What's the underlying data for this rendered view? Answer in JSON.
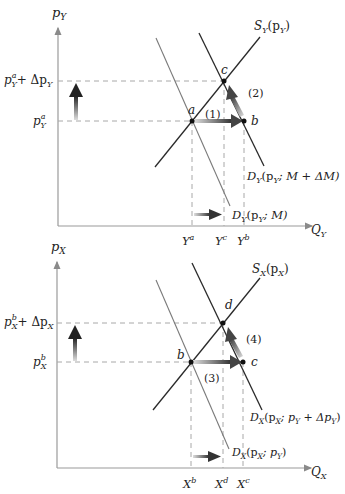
{
  "colors": {
    "axis": "#9a9a9a",
    "curve_dark": "#2a2a2a",
    "curve_light": "#7a7a7a",
    "dash": "#a0a0a0",
    "text": "#222222",
    "arrow": "#333333"
  },
  "top_panel": {
    "y_axis_label": "p",
    "y_axis_sub": "Y",
    "x_axis_label": "Q",
    "x_axis_sub": "Y",
    "price_high": {
      "base": "p",
      "sup": "a",
      "sub": "Y",
      "suffix": "+ Δp",
      "suffix_sub": "Y"
    },
    "price_low": {
      "base": "p",
      "sup": "a",
      "sub": "Y"
    },
    "supply_label": {
      "base": "S",
      "sub": "Y",
      "args": "(p",
      "args_sub": "Y",
      "close": ")"
    },
    "demand_new_label": {
      "base": "D",
      "sub": "Y",
      "args": "(p",
      "args_sub": "Y",
      "rest": "; M + ΔM)"
    },
    "demand_old_label": {
      "base": "D",
      "sub": "Y",
      "args": "(p",
      "args_sub": "Y",
      "rest": "; M)"
    },
    "points": {
      "a": "a",
      "b": "b",
      "c": "c"
    },
    "steps": {
      "one": "(1)",
      "two": "(2)"
    },
    "ticks": [
      {
        "base": "Y",
        "sup": "a"
      },
      {
        "base": "Y",
        "sup": "c"
      },
      {
        "base": "Y",
        "sup": "b"
      }
    ]
  },
  "bottom_panel": {
    "y_axis_label": "p",
    "y_axis_sub": "X",
    "x_axis_label": "Q",
    "x_axis_sub": "X",
    "price_high": {
      "base": "p",
      "sup": "b",
      "sub": "X",
      "suffix": "+ Δp",
      "suffix_sub": "X"
    },
    "price_low": {
      "base": "p",
      "sup": "b",
      "sub": "X"
    },
    "supply_label": {
      "base": "S",
      "sub": "X",
      "args": "(p",
      "args_sub": "X",
      "close": ")"
    },
    "demand_new_label": {
      "base": "D",
      "sub": "X",
      "args": "(p",
      "args_sub": "X",
      "rest": "; p",
      "rest_sub": "Y",
      "rest2": " + Δp",
      "rest2_sub": "Y",
      "close": ")"
    },
    "demand_old_label": {
      "base": "D",
      "sub": "X",
      "args": "(p",
      "args_sub": "X",
      "rest": "; p",
      "rest_sub": "Y",
      "close": ")"
    },
    "points": {
      "b": "b",
      "c": "c",
      "d": "d"
    },
    "steps": {
      "three": "(3)",
      "four": "(4)"
    },
    "ticks": [
      {
        "base": "X",
        "sup": "b"
      },
      {
        "base": "X",
        "sup": "d"
      },
      {
        "base": "X",
        "sup": "c"
      }
    ]
  }
}
